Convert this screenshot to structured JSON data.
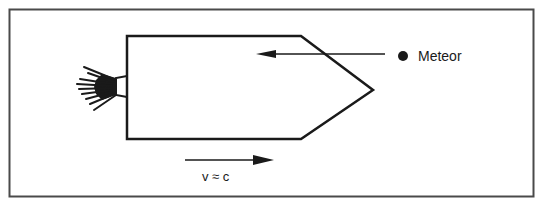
{
  "diagram": {
    "meteor_label": "Meteor",
    "velocity_label": "v ≈ c",
    "elements": {
      "ship": "spaceship-hull",
      "exhaust": "rocket-exhaust-flame",
      "meteor": "meteor-dot",
      "meteor_path": "left-pointing-arrow",
      "velocity_arrow": "right-pointing-arrow"
    },
    "colors": {
      "ink": "#1a1a1a",
      "frame": "#4a4a4a",
      "background": "#ffffff"
    }
  }
}
